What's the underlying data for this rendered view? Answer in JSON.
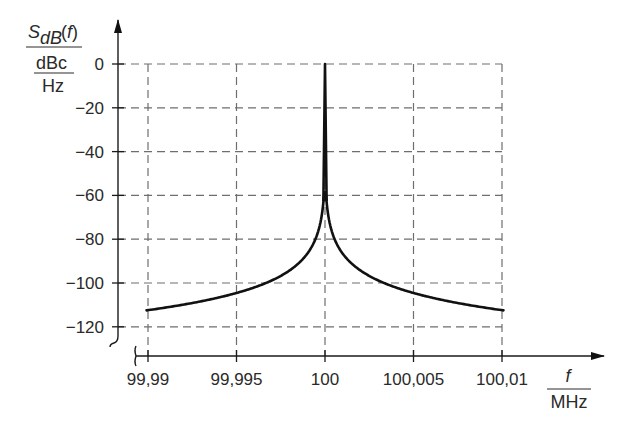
{
  "chart_data": {
    "type": "line",
    "title": "",
    "ylabel": {
      "numerator": "S",
      "numerator_sub": "dB",
      "numerator_arg": "(f)",
      "denominator_top": "dBc",
      "denominator_bottom": "Hz"
    },
    "xlabel": {
      "numerator": "f",
      "denominator": "MHz"
    },
    "x_ticks": [
      {
        "value": 99.99,
        "label": "99,99"
      },
      {
        "value": 99.995,
        "label": "99,995"
      },
      {
        "value": 100,
        "label": "100"
      },
      {
        "value": 100.005,
        "label": "100,005"
      },
      {
        "value": 100.01,
        "label": "100,01"
      }
    ],
    "y_ticks": [
      {
        "value": 0,
        "label": "0"
      },
      {
        "value": -20,
        "label": "−20"
      },
      {
        "value": -40,
        "label": "−40"
      },
      {
        "value": -60,
        "label": "−60"
      },
      {
        "value": -80,
        "label": "−80"
      },
      {
        "value": -100,
        "label": "−100"
      },
      {
        "value": -120,
        "label": "−120"
      }
    ],
    "xlim": [
      99.99,
      100.01
    ],
    "ylim": [
      -130,
      0
    ],
    "grid": true,
    "legend": null,
    "axis_breaks": [
      "x-axis near origin",
      "y-axis near origin"
    ],
    "series": [
      {
        "name": "phase noise spectrum (outer)",
        "x": [
          99.99,
          99.992,
          99.994,
          99.995,
          99.996,
          99.997,
          99.998,
          99.999,
          99.9995,
          99.9998,
          99.9999,
          100,
          100.0001,
          100.0002,
          100.0005,
          100.001,
          100.002,
          100.003,
          100.004,
          100.005,
          100.006,
          100.008,
          100.01
        ],
        "values": [
          -112,
          -110,
          -108,
          -106,
          -104,
          -101,
          -96,
          -86,
          -76,
          -66,
          -60,
          0,
          -60,
          -66,
          -76,
          -86,
          -96,
          -101,
          -104,
          -106,
          -108,
          -110,
          -112
        ]
      },
      {
        "name": "phase noise spectrum (inner branch)",
        "x": [
          99.9998,
          99.9999,
          100,
          100.0001,
          100.0002
        ],
        "values": [
          -70,
          -64,
          -62,
          -64,
          -70
        ]
      }
    ]
  }
}
